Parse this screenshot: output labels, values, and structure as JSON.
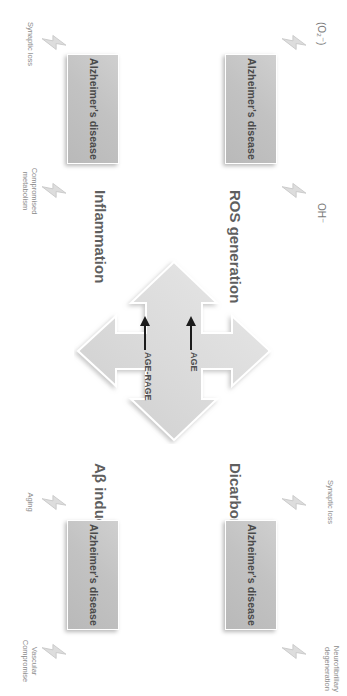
{
  "figure": {
    "type": "pathway-diagram",
    "orientation": "rotated-90-clockwise",
    "center_labels": {
      "age": "AGE",
      "age_rage": "AGE-RAGE"
    },
    "pathways": [
      {
        "id": "ros",
        "direction": "up",
        "label": "ROS generation",
        "outcome": "Alzheimer's disease",
        "mediators": [
          "OH⁻",
          "(O₂⁻)"
        ],
        "effects": []
      },
      {
        "id": "dicarbonyls",
        "direction": "right",
        "label": "Dicarbonyls stress",
        "outcome": "Alzheimer's disease",
        "mediators": [],
        "effects": [
          "Neurofibrillary\ndegeneration",
          "Synaptic loss"
        ]
      },
      {
        "id": "abeta",
        "direction": "down",
        "label": "Aβ induction",
        "outcome": "Alzheimer's disease",
        "mediators": [
          "Aging"
        ],
        "effects": [
          "Vascular\nCompromise"
        ]
      },
      {
        "id": "inflammation",
        "direction": "left",
        "label": "Inflammation",
        "outcome": "Alzheimer's disease",
        "mediators": [],
        "effects": [
          "Compromised\nmetabolism",
          "Synaptic loss"
        ]
      }
    ],
    "outcome_boxes": [
      {
        "id": "box-ros",
        "label": "Alzheimer's disease"
      },
      {
        "id": "box-dicarbonyls",
        "label": "Alzheimer's disease"
      },
      {
        "id": "box-abeta",
        "label": "Alzheimer's disease"
      },
      {
        "id": "box-inflammation",
        "label": "Alzheimer's disease"
      }
    ],
    "annotations": {
      "neurofibrillary": "Neurofibrillary\ndegeneration",
      "synaptic_loss_top": "Synaptic loss",
      "hydroxyl": "OH⁻",
      "superoxide": "(O₂⁻)",
      "aging": "Aging",
      "vascular": "Vascular\nCompromise",
      "compromised_metabolism": "Compromised\nmetabolism",
      "synaptic_loss_bottom": "Synaptic loss"
    },
    "colors": {
      "box_fill": "#c4c4c4",
      "arrow_fill": "#dcdcdc",
      "text_dark": "#4a4a4a",
      "text_muted": "#8b8b8b",
      "background": "#ffffff"
    }
  }
}
